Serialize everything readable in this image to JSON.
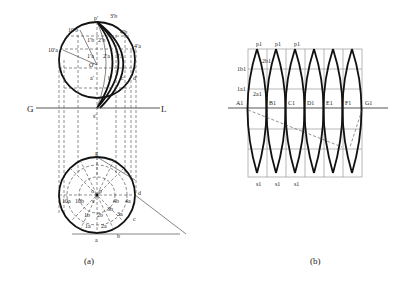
{
  "figure_a": {
    "caption": "(a)",
    "ground_line": {
      "left": "G",
      "right": "L"
    },
    "front_view_labels": {
      "p": "p′",
      "o": "O′",
      "s": "s′",
      "3b": "3′b",
      "4b": "4′b",
      "4a": "4′a",
      "10b": "10′b",
      "10a": "10′a",
      "1b": "1′b",
      "2b": "2′b",
      "1a": "1′a",
      "2a": "2′a",
      "3a": "3′a",
      "a": "a′",
      "b": "b′",
      "c": "c′",
      "d": "d′"
    },
    "top_view_labels": {
      "g": "g",
      "o": "o",
      "p": "p",
      "s": "s",
      "10a": "10a",
      "10b": "10b",
      "4b": "4b",
      "4a": "4a",
      "3b": "3b",
      "3a": "3a",
      "1b": "1b",
      "2b": "2b",
      "1a": "1a",
      "2a": "2a",
      "a": "a",
      "b": "b",
      "c": "c",
      "d": "d"
    }
  },
  "figure_b": {
    "caption": "(b)",
    "top_labels": [
      "p1",
      "p1",
      "p1"
    ],
    "bottom_labels": [
      "s1",
      "s1",
      "s1"
    ],
    "left_labels": {
      "1b": "1b1",
      "2b": "2b1",
      "1a": "1a1",
      "2a": "2a1"
    },
    "axis_points": [
      "A1",
      "B1",
      "C1",
      "D1",
      "E1",
      "F1",
      "G1"
    ]
  }
}
